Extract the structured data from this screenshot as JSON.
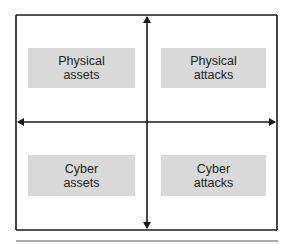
{
  "diagram": {
    "title": "",
    "quadrants": [
      {
        "position": "top-left",
        "line1": "Physical",
        "line2": "assets"
      },
      {
        "position": "top-right",
        "line1": "Physical",
        "line2": "attacks"
      },
      {
        "position": "bottom-left",
        "line1": "Cyber",
        "line2": "assets"
      },
      {
        "position": "bottom-right",
        "line1": "Cyber",
        "line2": "attacks"
      }
    ],
    "arrows": [
      {
        "from": "center",
        "to": "top",
        "direction": "up"
      },
      {
        "from": "center",
        "to": "bottom",
        "direction": "down"
      },
      {
        "from": "center",
        "to": "left",
        "direction": "left"
      },
      {
        "from": "center",
        "to": "right",
        "direction": "right"
      }
    ],
    "colors": {
      "line": "#1a1a1a",
      "box_fill": "#d9d9d9",
      "separator": "#8c8c8c",
      "text": "#222222"
    }
  }
}
